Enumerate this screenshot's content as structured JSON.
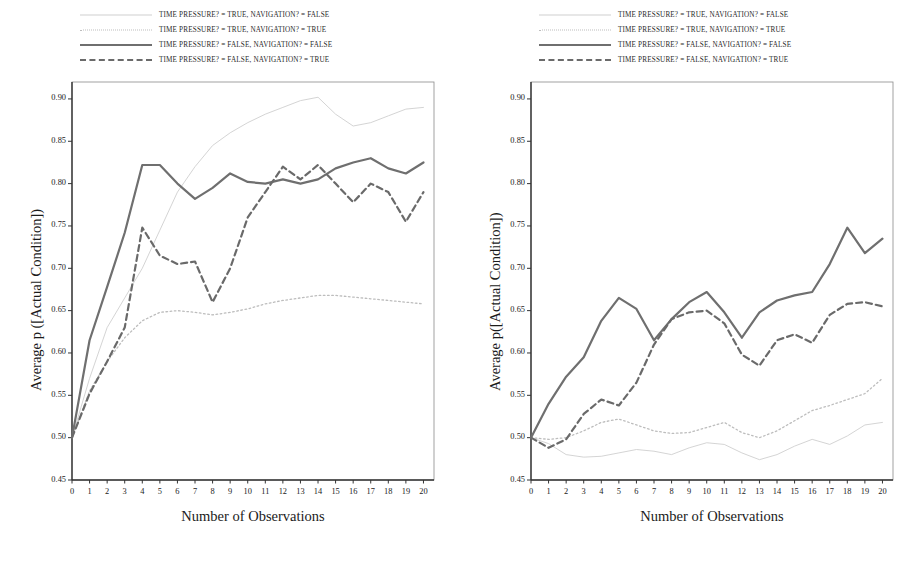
{
  "figure": {
    "panels": [
      {
        "id": "left",
        "y_axis_title": "Average p ([Actual Condition])",
        "x_axis_title": "Number of Observations"
      },
      {
        "id": "right",
        "y_axis_title": "Average p([Actual Condition])",
        "x_axis_title": "Number of Observations"
      }
    ],
    "legend": {
      "entries": [
        {
          "style": "thin-solid",
          "label": "TIME PRESSURE? = TRUE, NAVIGATION? = FALSE"
        },
        {
          "style": "thin-dotted",
          "label": "TIME PRESSURE? = TRUE, NAVIGATION? = TRUE"
        },
        {
          "style": "thick-solid",
          "label": "TIME PRESSURE? = FALSE, NAVIGATION? = FALSE"
        },
        {
          "style": "dashed",
          "label": "TIME PRESSURE? = FALSE, NAVIGATION? = TRUE"
        }
      ]
    },
    "colors": {
      "thin_solid": "#cfcfcf",
      "thin_dotted": "#bdbdbd",
      "thick_solid": "#6f6f6f",
      "dashed": "#6a6a6a",
      "axis": "#333333",
      "text": "#1b1b1b",
      "background": "#ffffff"
    }
  },
  "chart_data": [
    {
      "type": "line",
      "panel": "left",
      "title": "",
      "xlabel": "Number of Observations",
      "ylabel": "Average p ([Actual Condition])",
      "x": [
        0,
        1,
        2,
        3,
        4,
        5,
        6,
        7,
        8,
        9,
        10,
        11,
        12,
        13,
        14,
        15,
        16,
        17,
        18,
        19,
        20
      ],
      "xlim": [
        0,
        20.6
      ],
      "ylim": [
        0.45,
        0.92
      ],
      "yticks": [
        0.45,
        0.5,
        0.55,
        0.6,
        0.65,
        0.7,
        0.75,
        0.8,
        0.85,
        0.9
      ],
      "ytick_labels": [
        "0.45",
        "0.50",
        "0.55",
        "0.60",
        "0.65",
        "0.70",
        "0.75",
        "0.80",
        "0.85",
        "0.90"
      ],
      "xticks": [
        0,
        1,
        2,
        3,
        4,
        5,
        6,
        7,
        8,
        9,
        10,
        11,
        12,
        13,
        14,
        15,
        16,
        17,
        18,
        19,
        20
      ],
      "grid": false,
      "legend_position": "above",
      "series": [
        {
          "name": "TIME PRESSURE? = TRUE, NAVIGATION? = FALSE",
          "style": "thin-solid",
          "color": "#cfcfcf",
          "values": [
            0.5,
            0.57,
            0.63,
            0.665,
            0.7,
            0.745,
            0.79,
            0.82,
            0.845,
            0.86,
            0.872,
            0.882,
            0.89,
            0.898,
            0.902,
            0.882,
            0.868,
            0.872,
            0.88,
            0.888,
            0.89
          ]
        },
        {
          "name": "TIME PRESSURE? = TRUE, NAVIGATION? = TRUE",
          "style": "thin-dotted",
          "color": "#bdbdbd",
          "values": [
            0.5,
            0.555,
            0.59,
            0.618,
            0.638,
            0.648,
            0.65,
            0.648,
            0.645,
            0.648,
            0.652,
            0.658,
            0.662,
            0.665,
            0.668,
            0.668,
            0.666,
            0.664,
            0.662,
            0.66,
            0.658
          ]
        },
        {
          "name": "TIME PRESSURE? = FALSE, NAVIGATION? = FALSE",
          "style": "thick-solid",
          "color": "#6f6f6f",
          "values": [
            0.5,
            0.615,
            0.678,
            0.742,
            0.822,
            0.822,
            0.8,
            0.782,
            0.795,
            0.812,
            0.802,
            0.8,
            0.805,
            0.8,
            0.805,
            0.818,
            0.825,
            0.83,
            0.818,
            0.812,
            0.825
          ]
        },
        {
          "name": "TIME PRESSURE? = FALSE, NAVIGATION? = TRUE",
          "style": "dashed",
          "color": "#6a6a6a",
          "values": [
            0.5,
            0.552,
            0.59,
            0.63,
            0.748,
            0.715,
            0.705,
            0.708,
            0.66,
            0.7,
            0.76,
            0.79,
            0.82,
            0.805,
            0.822,
            0.8,
            0.778,
            0.8,
            0.79,
            0.755,
            0.79
          ]
        }
      ]
    },
    {
      "type": "line",
      "panel": "right",
      "title": "",
      "xlabel": "Number of Observations",
      "ylabel": "Average p([Actual Condition])",
      "x": [
        0,
        1,
        2,
        3,
        4,
        5,
        6,
        7,
        8,
        9,
        10,
        11,
        12,
        13,
        14,
        15,
        16,
        17,
        18,
        19,
        20
      ],
      "xlim": [
        0,
        20.6
      ],
      "ylim": [
        0.45,
        0.92
      ],
      "yticks": [
        0.45,
        0.5,
        0.55,
        0.6,
        0.65,
        0.7,
        0.75,
        0.8,
        0.85,
        0.9
      ],
      "ytick_labels": [
        "0.45",
        "0.50",
        "0.55",
        "0.60",
        "0.65",
        "0.70",
        "0.75",
        "0.80",
        "0.85",
        "0.90"
      ],
      "xticks": [
        0,
        1,
        2,
        3,
        4,
        5,
        6,
        7,
        8,
        9,
        10,
        11,
        12,
        13,
        14,
        15,
        16,
        17,
        18,
        19,
        20
      ],
      "grid": false,
      "legend_position": "above",
      "series": [
        {
          "name": "TIME PRESSURE? = TRUE, NAVIGATION? = FALSE",
          "style": "thin-solid",
          "color": "#cfcfcf",
          "values": [
            0.5,
            0.493,
            0.48,
            0.477,
            0.478,
            0.482,
            0.486,
            0.484,
            0.48,
            0.488,
            0.494,
            0.492,
            0.482,
            0.474,
            0.48,
            0.49,
            0.498,
            0.492,
            0.502,
            0.515,
            0.518
          ]
        },
        {
          "name": "TIME PRESSURE? = TRUE, NAVIGATION? = TRUE",
          "style": "thin-dotted",
          "color": "#bdbdbd",
          "values": [
            0.5,
            0.498,
            0.5,
            0.508,
            0.518,
            0.522,
            0.515,
            0.508,
            0.505,
            0.506,
            0.512,
            0.518,
            0.506,
            0.5,
            0.508,
            0.52,
            0.532,
            0.538,
            0.545,
            0.552,
            0.57
          ]
        },
        {
          "name": "TIME PRESSURE? = FALSE, NAVIGATION? = FALSE",
          "style": "thick-solid",
          "color": "#6f6f6f",
          "values": [
            0.5,
            0.54,
            0.572,
            0.595,
            0.638,
            0.665,
            0.652,
            0.615,
            0.64,
            0.66,
            0.672,
            0.648,
            0.618,
            0.648,
            0.662,
            0.668,
            0.672,
            0.705,
            0.748,
            0.718,
            0.735
          ]
        },
        {
          "name": "TIME PRESSURE? = FALSE, NAVIGATION? = TRUE",
          "style": "dashed",
          "color": "#6a6a6a",
          "values": [
            0.5,
            0.488,
            0.498,
            0.528,
            0.545,
            0.538,
            0.565,
            0.61,
            0.64,
            0.648,
            0.65,
            0.635,
            0.598,
            0.585,
            0.615,
            0.622,
            0.612,
            0.645,
            0.658,
            0.66,
            0.655
          ]
        }
      ]
    }
  ]
}
